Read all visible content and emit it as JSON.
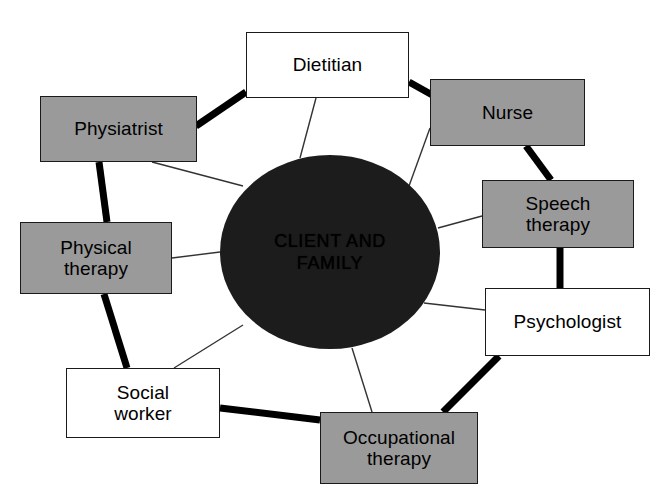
{
  "canvas": {
    "width": 658,
    "height": 495,
    "background": "#ffffff"
  },
  "colors": {
    "box_fill_gray": "#9a9a9a",
    "box_fill_white": "#ffffff",
    "box_border": "#1a1a1a",
    "hub_fill": "#1c1c1c",
    "spoke_line": "#333333",
    "ring_line": "#000000"
  },
  "hub": {
    "label": "CLIENT AND\nFAMILY",
    "cx": 330,
    "cy": 252,
    "rx": 110,
    "ry": 97
  },
  "nodes": [
    {
      "id": "dietitian",
      "label": "Dietitian",
      "fill": "gray_no",
      "shade": "white",
      "x": 246,
      "y": 32,
      "w": 163,
      "h": 66
    },
    {
      "id": "nurse",
      "label": "Nurse",
      "shade": "gray",
      "x": 430,
      "y": 79,
      "w": 155,
      "h": 67
    },
    {
      "id": "speech-therapy",
      "label": "Speech\ntherapy",
      "shade": "gray",
      "x": 482,
      "y": 180,
      "w": 152,
      "h": 68
    },
    {
      "id": "psychologist",
      "label": "Psychologist",
      "shade": "white",
      "x": 485,
      "y": 288,
      "w": 165,
      "h": 68
    },
    {
      "id": "occupational-therapy",
      "label": "Occupational\ntherapy",
      "shade": "gray",
      "x": 320,
      "y": 412,
      "w": 158,
      "h": 72
    },
    {
      "id": "social-worker",
      "label": "Social\nworker",
      "shade": "white",
      "x": 66,
      "y": 368,
      "w": 154,
      "h": 70
    },
    {
      "id": "physical-therapy",
      "label": "Physical\ntherapy",
      "shade": "gray",
      "x": 20,
      "y": 222,
      "w": 152,
      "h": 72
    },
    {
      "id": "physiatrist",
      "label": "Physiatrist",
      "shade": "gray",
      "x": 40,
      "y": 96,
      "w": 157,
      "h": 66
    }
  ],
  "spokes": [
    {
      "from": "dietitian",
      "to": "hub",
      "x1": 316,
      "y1": 98,
      "x2": 300,
      "y2": 158
    },
    {
      "from": "nurse",
      "to": "hub",
      "x1": 430,
      "y1": 128,
      "x2": 409,
      "y2": 186
    },
    {
      "from": "speech-therapy",
      "to": "hub",
      "x1": 482,
      "y1": 216,
      "x2": 438,
      "y2": 228
    },
    {
      "from": "psychologist",
      "to": "hub",
      "x1": 485,
      "y1": 310,
      "x2": 424,
      "y2": 303
    },
    {
      "from": "occupational-therapy",
      "to": "hub",
      "x1": 372,
      "y1": 412,
      "x2": 352,
      "y2": 348
    },
    {
      "from": "social-worker",
      "to": "hub",
      "x1": 174,
      "y1": 368,
      "x2": 243,
      "y2": 325
    },
    {
      "from": "physical-therapy",
      "to": "hub",
      "x1": 172,
      "y1": 258,
      "x2": 220,
      "y2": 252
    },
    {
      "from": "physiatrist",
      "to": "hub",
      "x1": 152,
      "y1": 162,
      "x2": 243,
      "y2": 186
    }
  ],
  "ring_links": [
    {
      "from": "physiatrist",
      "to": "dietitian",
      "x1": 196,
      "y1": 126,
      "x2": 246,
      "y2": 92
    },
    {
      "from": "dietitian",
      "to": "nurse",
      "x1": 409,
      "y1": 82,
      "x2": 443,
      "y2": 101
    },
    {
      "from": "nurse",
      "to": "speech-therapy",
      "x1": 526,
      "y1": 146,
      "x2": 551,
      "y2": 180
    },
    {
      "from": "speech-therapy",
      "to": "psychologist",
      "x1": 560,
      "y1": 248,
      "x2": 560,
      "y2": 288
    },
    {
      "from": "psychologist",
      "to": "occupational-therapy",
      "x1": 499,
      "y1": 356,
      "x2": 443,
      "y2": 412
    },
    {
      "from": "occupational-therapy",
      "to": "social-worker",
      "x1": 320,
      "y1": 420,
      "x2": 220,
      "y2": 408
    },
    {
      "from": "social-worker",
      "to": "physical-therapy",
      "x1": 127,
      "y1": 368,
      "x2": 104,
      "y2": 294
    },
    {
      "from": "physical-therapy",
      "to": "physiatrist",
      "x1": 107,
      "y1": 222,
      "x2": 99,
      "y2": 162
    }
  ]
}
